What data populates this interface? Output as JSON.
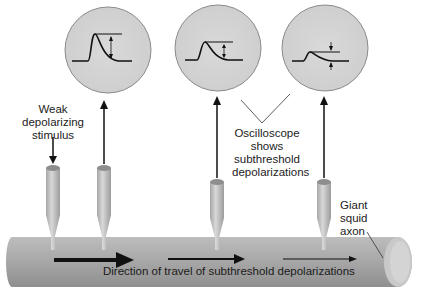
{
  "diagram": {
    "type": "neuroscience-illustration",
    "labels": {
      "stimulus": "Weak depolarizing stimulus",
      "stimulus_lines": [
        "Weak",
        "depolarizing",
        "stimulus"
      ],
      "oscilloscope": "Oscilloscope shows subthreshold depolarizations",
      "oscilloscope_lines": [
        "Oscilloscope",
        "shows",
        "subthreshold",
        "depolarizations"
      ],
      "axon": "Giant squid axon",
      "axon_lines": [
        "Giant",
        "squid",
        "axon"
      ],
      "direction": "Direction of travel of subthreshold depolarizations"
    },
    "oscilloscopes": [
      {
        "id": 1,
        "cx": 108,
        "cy": 50,
        "amplitude": "large"
      },
      {
        "id": 2,
        "cx": 218,
        "cy": 48,
        "amplitude": "medium"
      },
      {
        "id": 3,
        "cx": 325,
        "cy": 48,
        "amplitude": "small"
      }
    ],
    "electrodes": [
      {
        "id": 1,
        "x": 53,
        "role": "stimulating"
      },
      {
        "id": 2,
        "x": 104,
        "role": "recording"
      },
      {
        "id": 3,
        "x": 217,
        "role": "recording"
      },
      {
        "id": 4,
        "x": 324,
        "role": "recording"
      }
    ],
    "colors": {
      "scope_fill": "#d6d6d6",
      "scope_stroke": "#8a8a8a",
      "axon_fill": "#a8a8a8",
      "electrode_fill": "#c4c4c4",
      "arrow": "#111111"
    }
  }
}
